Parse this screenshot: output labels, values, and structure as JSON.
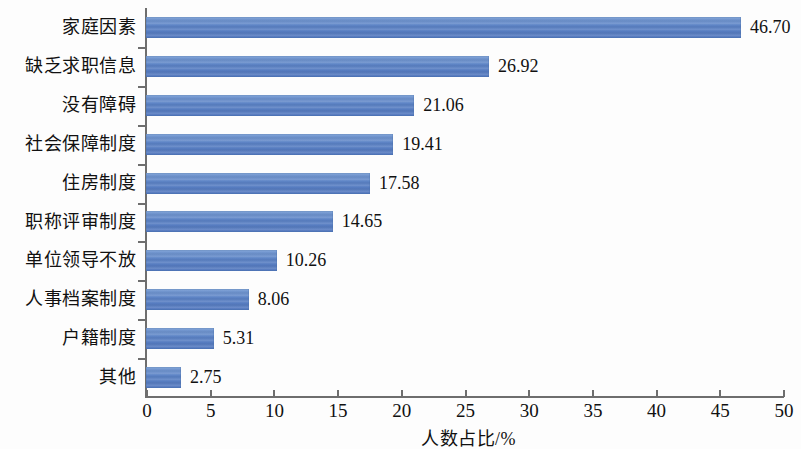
{
  "chart_data": {
    "type": "bar",
    "orientation": "horizontal",
    "title": "",
    "subtitle": "",
    "xlabel": "人数占比/%",
    "ylabel": "",
    "categories": [
      "家庭因素",
      "缺乏求职信息",
      "没有障碍",
      "社会保障制度",
      "住房制度",
      "职称评审制度",
      "单位领导不放",
      "人事档案制度",
      "户籍制度",
      "其他"
    ],
    "values": [
      46.7,
      26.92,
      21.06,
      19.41,
      17.58,
      14.65,
      10.26,
      8.06,
      5.31,
      2.75
    ],
    "value_labels": [
      "46.70",
      "26.92",
      "21.06",
      "19.41",
      "17.58",
      "14.65",
      "10.26",
      "8.06",
      "5.31",
      "2.75"
    ],
    "xlim": [
      0,
      50
    ],
    "xticks": [
      0,
      5,
      10,
      15,
      20,
      25,
      30,
      35,
      40,
      45,
      50
    ],
    "xtick_labels": [
      "0",
      "5",
      "10",
      "15",
      "20",
      "25",
      "30",
      "35",
      "40",
      "45",
      "50"
    ],
    "grid": false,
    "legend": null,
    "legend_position": "none",
    "series": [
      {
        "name": "人数占比",
        "values": [
          46.7,
          26.92,
          21.06,
          19.41,
          17.58,
          14.65,
          10.26,
          8.06,
          5.31,
          2.75
        ],
        "color": "#5B82C5"
      }
    ],
    "colors": {
      "bar": "#5B82C5",
      "bar_light": "#7A9ED4",
      "axis": "#6E6E6E",
      "text": "#111111",
      "background": "#FDFDFD"
    }
  }
}
